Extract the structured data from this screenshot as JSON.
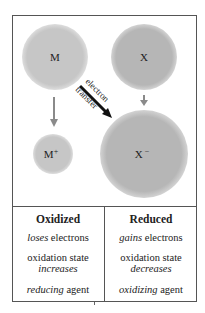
{
  "diagram": {
    "species": {
      "m": {
        "label": "M",
        "color": "#c6c6c6"
      },
      "x": {
        "label": "X",
        "color": "#b6b6b6"
      },
      "m_plus": {
        "label": "M",
        "charge": "+",
        "color": "#c6c6c6"
      },
      "x_minus": {
        "label": "X",
        "charge": "−",
        "color": "#b8b8b8"
      }
    },
    "transfer_arrow": {
      "line1": "electron",
      "line2": "transfer"
    },
    "arrow_color": "#8a8a8a"
  },
  "table": {
    "oxidized": {
      "heading": "Oxidized",
      "row1_italic": "loses",
      "row1_rest": " electrons",
      "row2_line1": "oxidation state",
      "row2_italic": "increases",
      "row3_italic": "reducing",
      "row3_rest": " agent"
    },
    "reduced": {
      "heading": "Reduced",
      "row1_italic": "gains",
      "row1_rest": " electrons",
      "row2_line1": "oxidation state",
      "row2_italic": "decreases",
      "row3_italic": "oxidizing",
      "row3_rest": " agent"
    }
  }
}
